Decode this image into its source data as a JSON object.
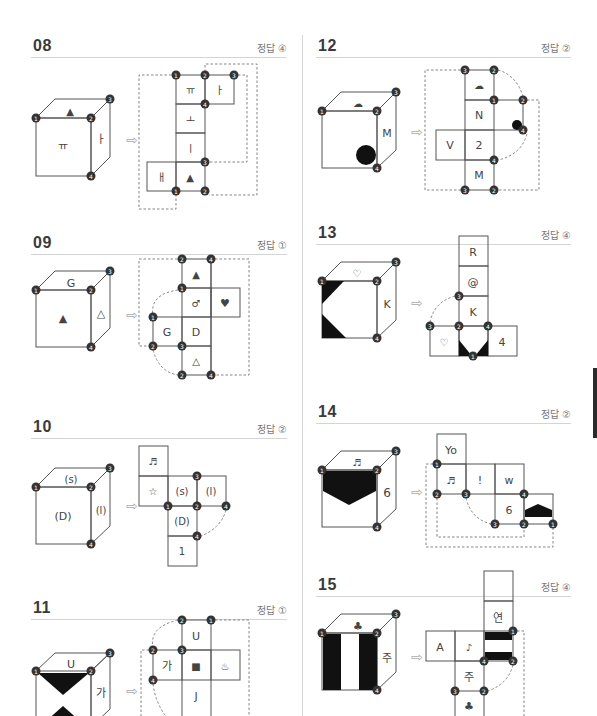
{
  "problems": [
    {
      "number": "08",
      "answer": "정답 ④",
      "cube": {
        "top": "▲",
        "front": "ㅠ",
        "right": "ㅏ"
      },
      "net": {
        "faces": [
          "ㅠ",
          "ㅏ",
          "ㅗ",
          "ㅣ",
          "ㅐ",
          "▲"
        ]
      },
      "markers": [
        "1",
        "2",
        "3",
        "4"
      ]
    },
    {
      "number": "09",
      "answer": "정답 ①",
      "cube": {
        "top": "G",
        "front": "▲",
        "right": "△"
      },
      "net": {
        "faces": [
          "▲",
          "♂",
          "♥",
          "G",
          "D",
          "△"
        ]
      },
      "markers": [
        "1",
        "2",
        "3",
        "4"
      ]
    },
    {
      "number": "10",
      "answer": "정답 ②",
      "cube": {
        "top": "(s)",
        "front": "(D)",
        "right": "(l)"
      },
      "net": {
        "faces": [
          "♬",
          "☆",
          "(s)",
          "(l)",
          "(D)",
          "1"
        ]
      },
      "markers": [
        "1",
        "2",
        "3",
        "4"
      ]
    },
    {
      "number": "11",
      "answer": "정답 ①",
      "cube": {
        "top": "U",
        "front": "",
        "right": "가"
      },
      "net": {
        "faces": [
          "U",
          "가",
          "■",
          "♨",
          "J"
        ]
      },
      "markers": [
        "1",
        "2",
        "3",
        "4"
      ]
    },
    {
      "number": "12",
      "answer": "정답 ②",
      "cube": {
        "top": "☁",
        "front": "",
        "right": "M"
      },
      "net": {
        "faces": [
          "☁",
          "N",
          "V",
          "2",
          "M"
        ]
      },
      "markers": [
        "1",
        "2",
        "3",
        "4"
      ]
    },
    {
      "number": "13",
      "answer": "정답 ④",
      "cube": {
        "top": "♡",
        "front": "",
        "right": "K"
      },
      "net": {
        "faces": [
          "R",
          "@",
          "K",
          "♡",
          "4"
        ]
      },
      "markers": [
        "1",
        "2",
        "3",
        "4"
      ]
    },
    {
      "number": "14",
      "answer": "정답 ②",
      "cube": {
        "top": "♬",
        "front": "",
        "right": "6"
      },
      "net": {
        "faces": [
          "Yo",
          "♬",
          "!",
          "w",
          "6"
        ]
      },
      "markers": [
        "1",
        "2",
        "3",
        "4"
      ]
    },
    {
      "number": "15",
      "answer": "정답 ④",
      "cube": {
        "top": "♣",
        "front": "",
        "right": "주"
      },
      "net": {
        "faces": [
          "연",
          "A",
          "♪",
          "주",
          "♣"
        ]
      },
      "markers": [
        "1",
        "2",
        "3",
        "4"
      ]
    }
  ],
  "icons": {
    "arrow": "⇨"
  }
}
